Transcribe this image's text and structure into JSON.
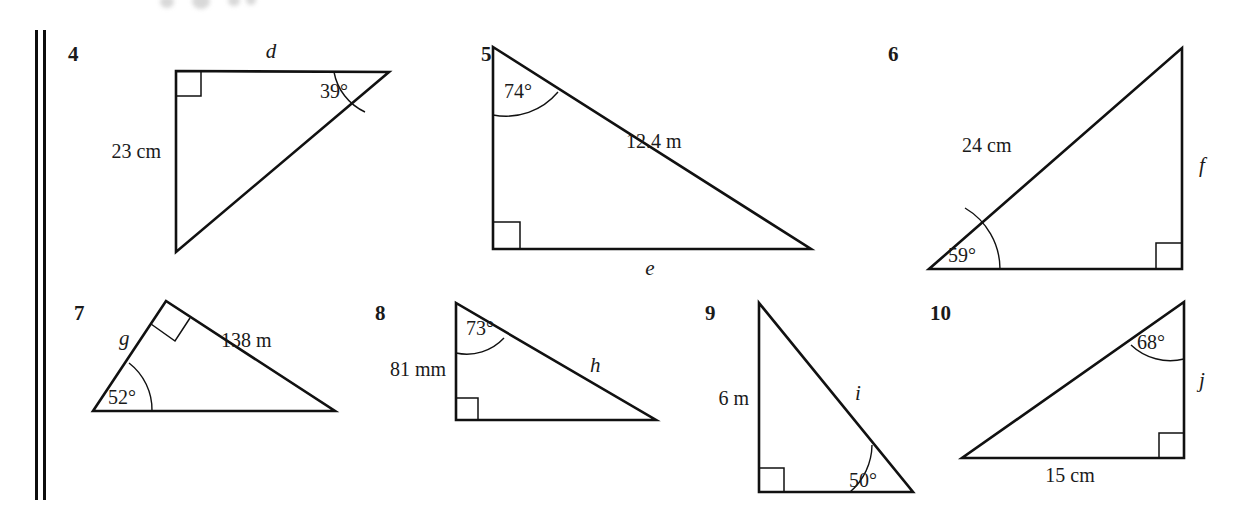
{
  "page": {
    "width": 1237,
    "height": 522,
    "background": "#ffffff",
    "ink_color": "#111111",
    "margin_rule_name": "double-vertical-margin-rule",
    "top_artifact_name": "faded-text-smudge"
  },
  "figures": [
    {
      "number": "4",
      "shape": "right-triangle",
      "right_angle_vertex": "top-left",
      "labels": {
        "top_side": "d",
        "left_side": "23 cm",
        "angle": "39°"
      },
      "given": {
        "side": "23 cm",
        "angle": "39°"
      },
      "unknown": "d"
    },
    {
      "number": "5",
      "shape": "right-triangle",
      "right_angle_vertex": "bottom-left",
      "labels": {
        "top_angle": "74°",
        "hypotenuse": "12.4 m",
        "bottom_side": "e"
      },
      "given": {
        "side": "12.4 m",
        "angle": "74°"
      },
      "unknown": "e"
    },
    {
      "number": "6",
      "shape": "right-triangle",
      "right_angle_vertex": "bottom-right",
      "labels": {
        "hypotenuse": "24 cm",
        "right_side": "f",
        "angle": "59°"
      },
      "given": {
        "side": "24 cm",
        "angle": "59°"
      },
      "unknown": "f"
    },
    {
      "number": "7",
      "shape": "right-triangle",
      "right_angle_vertex": "apex",
      "labels": {
        "left_side": "g",
        "right_side": "138 m",
        "angle": "52°"
      },
      "given": {
        "side": "138 m",
        "angle": "52°"
      },
      "unknown": "g"
    },
    {
      "number": "8",
      "shape": "right-triangle",
      "right_angle_vertex": "bottom-left",
      "labels": {
        "top_angle": "73°",
        "left_side": "81 mm",
        "hypotenuse": "h"
      },
      "given": {
        "side": "81 mm",
        "angle": "73°"
      },
      "unknown": "h"
    },
    {
      "number": "9",
      "shape": "right-triangle",
      "right_angle_vertex": "bottom-left",
      "labels": {
        "left_side": "6 m",
        "hypotenuse": "i",
        "angle": "50°"
      },
      "given": {
        "side": "6 m",
        "angle": "50°"
      },
      "unknown": "i"
    },
    {
      "number": "10",
      "shape": "right-triangle",
      "right_angle_vertex": "bottom-right",
      "labels": {
        "top_angle": "68°",
        "right_side": "j",
        "bottom_side": "15 cm"
      },
      "given": {
        "side": "15 cm",
        "angle": "68°"
      },
      "unknown": "j"
    }
  ]
}
